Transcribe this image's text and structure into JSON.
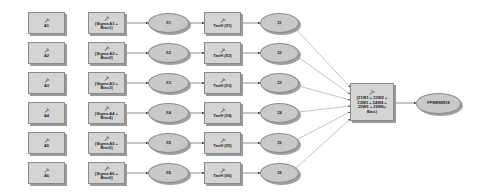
{
  "diagram": {
    "rows": [
      {
        "input": "A1",
        "sum": "[Sigma A1 +\nBias1]",
        "x": "X1",
        "tanh": "TanH (X1)",
        "z": "Z1"
      },
      {
        "input": "A2",
        "sum": "[Sigma A2 +\nBias2]",
        "x": "X2",
        "tanh": "TanH (X2)",
        "z": "Z2"
      },
      {
        "input": "A3",
        "sum": "[Sigma A3 +\nBias3]",
        "x": "X3",
        "tanh": "TanH (X3)",
        "z": "Z3"
      },
      {
        "input": "A4",
        "sum": "[Sigma A4 +\nBias4]",
        "x": "X4",
        "tanh": "TanH (X4)",
        "z": "Z4"
      },
      {
        "input": "A5",
        "sum": "[Sigma A5 +\nBias5]",
        "x": "X5",
        "tanh": "TanH (X5)",
        "z": "Z5"
      },
      {
        "input": "A6",
        "sum": "[Sigma A6 +\nBias6]",
        "x": "X6",
        "tanh": "TanH (X6)",
        "z": "Z6"
      }
    ],
    "combine": "[Z1W1 + Z2W2 +\nZ3W3 + Z4W4 +\nZ5W5 + Z6W6+\nBias]",
    "output": "FPMKMM18",
    "colors": {
      "box_fill": "#d4d4d4",
      "ellipse_fill": "#c9c9c9",
      "stroke": "#8a8a8a",
      "line": "#555555"
    }
  }
}
